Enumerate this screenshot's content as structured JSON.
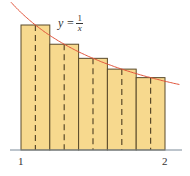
{
  "diagram": {
    "function_label": {
      "lhs": "y =",
      "numerator": "1",
      "denominator": "x"
    },
    "x_ticks": [
      {
        "label": "1",
        "value": 1
      },
      {
        "label": "2",
        "value": 2
      }
    ],
    "interval": [
      1,
      2
    ],
    "n_rectangles": 5,
    "sample_points": [
      1.1,
      1.3,
      1.5,
      1.7,
      1.9
    ],
    "colors": {
      "rect_fill": "#f7d98e",
      "rect_stroke": "#5a4a2a",
      "curve": "#e2553c",
      "axis": "#7a8a99"
    }
  },
  "chart_data": {
    "type": "bar",
    "categories": [
      "[1,1.2]",
      "[1.2,1.4]",
      "[1.4,1.6]",
      "[1.6,1.8]",
      "[1.8,2]"
    ],
    "values": [
      0.909,
      0.769,
      0.667,
      0.588,
      0.526
    ],
    "curve": "y = 1/x",
    "xlabel": "",
    "ylabel": "",
    "xticks": [
      "1",
      "2"
    ]
  }
}
